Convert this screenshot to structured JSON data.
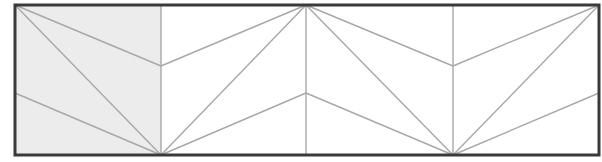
{
  "diagram": {
    "type": "folding-pattern",
    "width": 602,
    "height": 162,
    "colors": {
      "background": "#ffffff",
      "frame": "#3a3a3a",
      "fold_line": "#a8a8a8",
      "shaded_fill": "#ececec"
    },
    "frame": {
      "x1": 15,
      "y1": 5,
      "x2": 599,
      "y2": 155
    },
    "shaded_panel": {
      "x1": 15,
      "y1": 5,
      "x2": 161,
      "y2": 155
    },
    "panels": [
      {
        "label": "panel-1",
        "x1": 15,
        "x2": 161,
        "shaded": true
      },
      {
        "label": "panel-2",
        "x1": 161,
        "x2": 306,
        "shaded": false
      },
      {
        "label": "panel-3",
        "x1": 306,
        "x2": 453,
        "shaded": false
      },
      {
        "label": "panel-4",
        "x1": 453,
        "x2": 599,
        "shaded": false
      }
    ],
    "vertical_dividers": [
      161,
      306,
      453
    ],
    "fold_lines": [
      {
        "x1": 15,
        "y1": 5,
        "x2": 161,
        "y2": 155
      },
      {
        "x1": 15,
        "y1": 5,
        "x2": 161,
        "y2": 66
      },
      {
        "x1": 15,
        "y1": 93,
        "x2": 161,
        "y2": 155
      },
      {
        "x1": 161,
        "y1": 155,
        "x2": 306,
        "y2": 5
      },
      {
        "x1": 161,
        "y1": 66,
        "x2": 306,
        "y2": 5
      },
      {
        "x1": 161,
        "y1": 155,
        "x2": 306,
        "y2": 93
      },
      {
        "x1": 306,
        "y1": 5,
        "x2": 453,
        "y2": 155
      },
      {
        "x1": 306,
        "y1": 5,
        "x2": 453,
        "y2": 66
      },
      {
        "x1": 306,
        "y1": 93,
        "x2": 453,
        "y2": 155
      },
      {
        "x1": 453,
        "y1": 155,
        "x2": 599,
        "y2": 5
      },
      {
        "x1": 453,
        "y1": 66,
        "x2": 599,
        "y2": 5
      },
      {
        "x1": 453,
        "y1": 155,
        "x2": 599,
        "y2": 93
      }
    ]
  }
}
